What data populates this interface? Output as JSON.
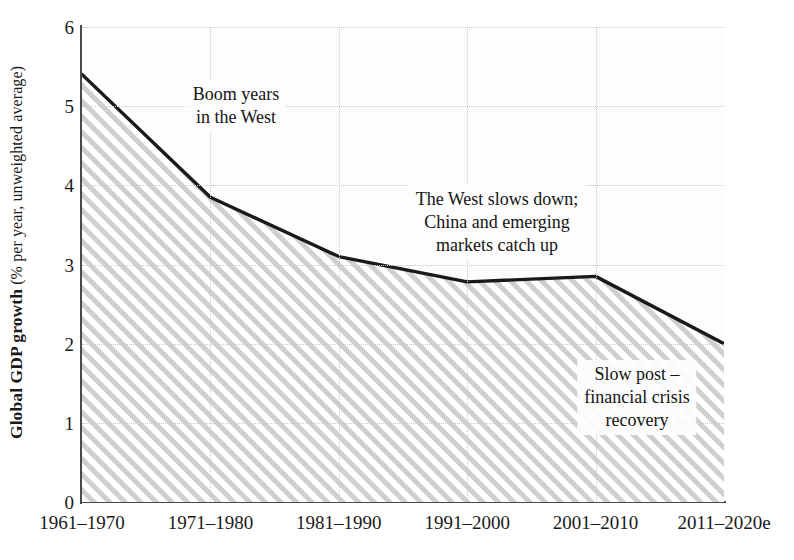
{
  "chart_data": {
    "type": "area",
    "title": "",
    "xlabel": "",
    "ylabel": "Global GDP growth (% per year, unweighted average)",
    "ylabel_bold_part": "Global GDP growth",
    "ylabel_light_part": " (% per year, unweighted average)",
    "categories": [
      "1961–1970",
      "1971–1980",
      "1981–1990",
      "1991–2000",
      "2001–2010",
      "2011–2020e"
    ],
    "values": [
      5.4,
      3.85,
      3.1,
      2.78,
      2.85,
      2.0
    ],
    "ylim": [
      0,
      6
    ],
    "yticks": [
      0,
      1,
      2,
      3,
      4,
      5,
      6
    ],
    "ytick_labels": [
      "0",
      "1",
      "2",
      "3",
      "4",
      "5",
      "6"
    ],
    "grid": true,
    "grid_style": "dotted",
    "legend": "none",
    "series": [
      {
        "name": "Global GDP growth",
        "values": [
          5.4,
          3.85,
          3.1,
          2.78,
          2.85,
          2.0
        ]
      }
    ],
    "fill": "diagonal-hatch",
    "line_color": "#1a1a1a",
    "hatch_color": "#c8c8c8",
    "annotations": [
      {
        "id": "boom-years",
        "lines": [
          "Boom years",
          "in the West"
        ],
        "x_px": 236,
        "y_px": 80
      },
      {
        "id": "west-slows",
        "lines": [
          "The West slows down;",
          "China and emerging",
          "markets catch up"
        ],
        "x_px": 497,
        "y_px": 185
      },
      {
        "id": "slow-recovery",
        "lines": [
          "Slow post –",
          "financial crisis",
          "recovery"
        ],
        "x_px": 637,
        "y_px": 360
      }
    ]
  },
  "colors": {
    "axis": "#4a4a4a",
    "grid": "#c9c9c9",
    "line": "#1a1a1a",
    "hatch": "#c8c8c8",
    "background": "#ffffff",
    "plot_background": "#fdfdfd",
    "text": "#1a1a1a"
  }
}
